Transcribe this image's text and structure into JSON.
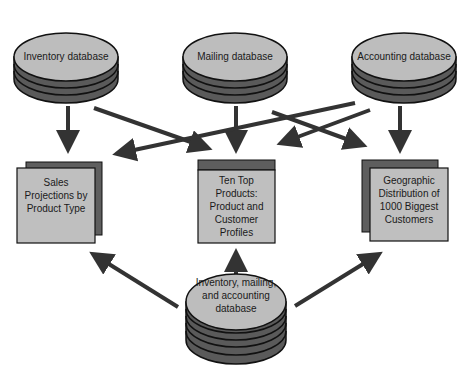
{
  "diagram": {
    "source_databases": [
      {
        "id": "inventory",
        "label": "Inventory database"
      },
      {
        "id": "mailing",
        "label": "Mailing database"
      },
      {
        "id": "accounting",
        "label": "Accounting database"
      }
    ],
    "reports": [
      {
        "id": "sales",
        "label": "Sales Projections by Product Type"
      },
      {
        "id": "tentop",
        "label": "Ten Top Products: Product and Customer Profiles"
      },
      {
        "id": "geo",
        "label": "Geographic Distribution of 1000 Biggest Customers"
      }
    ],
    "integrated_database": {
      "id": "integrated",
      "label": "Inventory, mailing, and accounting database"
    },
    "edges": [
      {
        "from": "inventory",
        "to": "sales"
      },
      {
        "from": "inventory",
        "to": "tentop"
      },
      {
        "from": "mailing",
        "to": "tentop"
      },
      {
        "from": "mailing",
        "to": "geo"
      },
      {
        "from": "accounting",
        "to": "geo"
      },
      {
        "from": "accounting",
        "to": "sales"
      },
      {
        "from": "accounting",
        "to": "tentop"
      },
      {
        "from": "integrated",
        "to": "sales"
      },
      {
        "from": "integrated",
        "to": "tentop"
      },
      {
        "from": "integrated",
        "to": "geo"
      }
    ],
    "colors": {
      "disk_top": "#bdbdbd",
      "disk_side": "#5a5a5a",
      "box_front": "#bfbfbf",
      "box_back": "#5e5e5e",
      "arrow": "#333333"
    }
  }
}
